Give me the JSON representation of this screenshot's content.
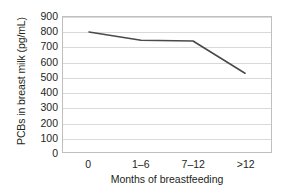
{
  "chart_data": {
    "type": "line",
    "title": "",
    "xlabel": "Months of breastfeeding",
    "ylabel": "PCBs in breast milk (pg/mL)",
    "categories": [
      "0",
      "1–6",
      "7–12",
      ">12"
    ],
    "values": [
      800,
      745,
      740,
      525
    ],
    "series": [
      {
        "name": "PCBs in breast milk",
        "values": [
          800,
          745,
          740,
          525
        ]
      }
    ],
    "ylim": [
      0,
      900
    ],
    "yticks": [
      0,
      100,
      200,
      300,
      400,
      500,
      600,
      700,
      800,
      900
    ],
    "ytick_labels": [
      "0",
      "100",
      "200",
      "300",
      "400",
      "500",
      "600",
      "700",
      "800",
      "900"
    ],
    "grid": "horizontal",
    "legend": "none",
    "markers": "none",
    "line_color": "#4a4a4a",
    "grid_color": "#d9d9d9",
    "frame_color": "#bfbfbf",
    "background_color": "#ffffff",
    "text_color": "#231f20"
  }
}
